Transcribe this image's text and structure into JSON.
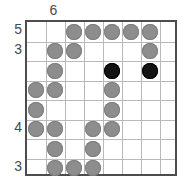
{
  "puzzle": {
    "type": "stone-grid-puzzle",
    "columns": 8,
    "rows": 8,
    "colors": {
      "gray_stone": "#8d8d8d",
      "black_stone": "#141414",
      "grid_line": "#b9b9b9",
      "border": "#4d4d4d",
      "label": "#4a4a4a",
      "background": "#ffffff"
    },
    "column_clues": [
      {
        "column": 1,
        "label": ""
      },
      {
        "column": 2,
        "label": "6"
      },
      {
        "column": 3,
        "label": ""
      },
      {
        "column": 4,
        "label": ""
      },
      {
        "column": 5,
        "label": ""
      },
      {
        "column": 6,
        "label": ""
      },
      {
        "column": 7,
        "label": ""
      },
      {
        "column": 8,
        "label": ""
      }
    ],
    "row_clues": [
      {
        "row": 1,
        "label": "5"
      },
      {
        "row": 2,
        "label": "3"
      },
      {
        "row": 3,
        "label": ""
      },
      {
        "row": 4,
        "label": ""
      },
      {
        "row": 5,
        "label": ""
      },
      {
        "row": 6,
        "label": "4"
      },
      {
        "row": 7,
        "label": ""
      },
      {
        "row": 8,
        "label": "3"
      }
    ],
    "cells": [
      {
        "row": 1,
        "col": 1,
        "state": "empty"
      },
      {
        "row": 1,
        "col": 2,
        "state": "empty"
      },
      {
        "row": 1,
        "col": 3,
        "state": "gray"
      },
      {
        "row": 1,
        "col": 4,
        "state": "gray"
      },
      {
        "row": 1,
        "col": 5,
        "state": "gray"
      },
      {
        "row": 1,
        "col": 6,
        "state": "gray"
      },
      {
        "row": 1,
        "col": 7,
        "state": "gray"
      },
      {
        "row": 1,
        "col": 8,
        "state": "empty"
      },
      {
        "row": 2,
        "col": 1,
        "state": "empty"
      },
      {
        "row": 2,
        "col": 2,
        "state": "gray"
      },
      {
        "row": 2,
        "col": 3,
        "state": "gray"
      },
      {
        "row": 2,
        "col": 4,
        "state": "empty"
      },
      {
        "row": 2,
        "col": 5,
        "state": "empty"
      },
      {
        "row": 2,
        "col": 6,
        "state": "empty"
      },
      {
        "row": 2,
        "col": 7,
        "state": "gray"
      },
      {
        "row": 2,
        "col": 8,
        "state": "empty"
      },
      {
        "row": 3,
        "col": 1,
        "state": "empty"
      },
      {
        "row": 3,
        "col": 2,
        "state": "gray"
      },
      {
        "row": 3,
        "col": 3,
        "state": "empty"
      },
      {
        "row": 3,
        "col": 4,
        "state": "empty"
      },
      {
        "row": 3,
        "col": 5,
        "state": "black"
      },
      {
        "row": 3,
        "col": 6,
        "state": "empty"
      },
      {
        "row": 3,
        "col": 7,
        "state": "black"
      },
      {
        "row": 3,
        "col": 8,
        "state": "empty"
      },
      {
        "row": 4,
        "col": 1,
        "state": "gray"
      },
      {
        "row": 4,
        "col": 2,
        "state": "gray"
      },
      {
        "row": 4,
        "col": 3,
        "state": "empty"
      },
      {
        "row": 4,
        "col": 4,
        "state": "empty"
      },
      {
        "row": 4,
        "col": 5,
        "state": "gray"
      },
      {
        "row": 4,
        "col": 6,
        "state": "empty"
      },
      {
        "row": 4,
        "col": 7,
        "state": "empty"
      },
      {
        "row": 4,
        "col": 8,
        "state": "empty"
      },
      {
        "row": 5,
        "col": 1,
        "state": "gray"
      },
      {
        "row": 5,
        "col": 2,
        "state": "empty"
      },
      {
        "row": 5,
        "col": 3,
        "state": "empty"
      },
      {
        "row": 5,
        "col": 4,
        "state": "empty"
      },
      {
        "row": 5,
        "col": 5,
        "state": "gray"
      },
      {
        "row": 5,
        "col": 6,
        "state": "empty"
      },
      {
        "row": 5,
        "col": 7,
        "state": "empty"
      },
      {
        "row": 5,
        "col": 8,
        "state": "empty"
      },
      {
        "row": 6,
        "col": 1,
        "state": "gray"
      },
      {
        "row": 6,
        "col": 2,
        "state": "gray"
      },
      {
        "row": 6,
        "col": 3,
        "state": "empty"
      },
      {
        "row": 6,
        "col": 4,
        "state": "gray"
      },
      {
        "row": 6,
        "col": 5,
        "state": "gray"
      },
      {
        "row": 6,
        "col": 6,
        "state": "empty"
      },
      {
        "row": 6,
        "col": 7,
        "state": "empty"
      },
      {
        "row": 6,
        "col": 8,
        "state": "empty"
      },
      {
        "row": 7,
        "col": 1,
        "state": "empty"
      },
      {
        "row": 7,
        "col": 2,
        "state": "gray"
      },
      {
        "row": 7,
        "col": 3,
        "state": "empty"
      },
      {
        "row": 7,
        "col": 4,
        "state": "gray"
      },
      {
        "row": 7,
        "col": 5,
        "state": "empty"
      },
      {
        "row": 7,
        "col": 6,
        "state": "empty"
      },
      {
        "row": 7,
        "col": 7,
        "state": "empty"
      },
      {
        "row": 7,
        "col": 8,
        "state": "empty"
      },
      {
        "row": 8,
        "col": 1,
        "state": "empty"
      },
      {
        "row": 8,
        "col": 2,
        "state": "gray"
      },
      {
        "row": 8,
        "col": 3,
        "state": "gray"
      },
      {
        "row": 8,
        "col": 4,
        "state": "gray"
      },
      {
        "row": 8,
        "col": 5,
        "state": "empty"
      },
      {
        "row": 8,
        "col": 6,
        "state": "empty"
      },
      {
        "row": 8,
        "col": 7,
        "state": "empty"
      },
      {
        "row": 8,
        "col": 8,
        "state": "empty"
      }
    ]
  }
}
